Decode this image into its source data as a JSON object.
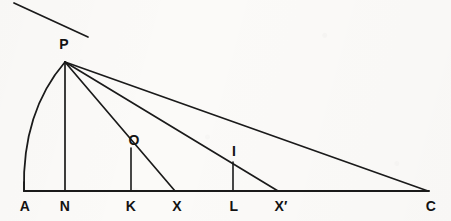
{
  "figure": {
    "kind": "geometric-construction-diagram",
    "canvas": {
      "width": 451,
      "height": 221
    },
    "colors": {
      "background": "#fbfaf8",
      "ink": "#1a1a1a",
      "label_ink": "#131313"
    },
    "baseline": {
      "name": "AC",
      "y": 191,
      "x_start": 24,
      "x_end": 429
    },
    "apex": {
      "label": "P",
      "x": 65,
      "y": 62
    },
    "tangent_line": {
      "x1": 14,
      "y1": 3,
      "x2": 88,
      "y2": 37,
      "through": "P"
    },
    "arc": {
      "from": "A",
      "to": "P",
      "start_x": 24,
      "start_y": 191,
      "end_x": 65,
      "end_y": 62,
      "control_x": 22,
      "control_y": 112
    },
    "points": [
      {
        "label": "A",
        "x": 24,
        "y": 191,
        "label_x": 25,
        "label_y": 206
      },
      {
        "label": "N",
        "x": 65,
        "y": 191,
        "label_x": 65,
        "label_y": 206
      },
      {
        "label": "K",
        "x": 131,
        "y": 191,
        "label_x": 131,
        "label_y": 206
      },
      {
        "label": "X",
        "x": 175,
        "y": 191,
        "label_x": 177,
        "label_y": 206
      },
      {
        "label": "L",
        "x": 233,
        "y": 191,
        "label_x": 234,
        "label_y": 206
      },
      {
        "label": "X′",
        "x": 278,
        "y": 191,
        "label_x": 281,
        "label_y": 206
      },
      {
        "label": "C",
        "x": 428,
        "y": 191,
        "label_x": 431,
        "label_y": 206
      },
      {
        "label": "P",
        "x": 65,
        "y": 62,
        "label_x": 64,
        "label_y": 44
      },
      {
        "label": "O",
        "x": 131,
        "y": 148,
        "label_x": 134,
        "label_y": 140
      },
      {
        "label": "I",
        "x": 233,
        "y": 162,
        "label_x": 234,
        "label_y": 151
      }
    ],
    "segments": [
      {
        "name": "baseline-A-C",
        "x1": 24,
        "y1": 191,
        "x2": 429,
        "y2": 191,
        "width": 2.0
      },
      {
        "name": "perpendicular-P-N",
        "x1": 65,
        "y1": 62,
        "x2": 65,
        "y2": 191,
        "width": 1.7
      },
      {
        "name": "ray-P-X",
        "x1": 65,
        "y1": 62,
        "x2": 175,
        "y2": 191,
        "width": 1.7
      },
      {
        "name": "ray-P-Xprime",
        "x1": 65,
        "y1": 62,
        "x2": 278,
        "y2": 191,
        "width": 1.7
      },
      {
        "name": "ray-P-C",
        "x1": 65,
        "y1": 62,
        "x2": 428,
        "y2": 191,
        "width": 1.7
      },
      {
        "name": "perpendicular-O-K",
        "x1": 131,
        "y1": 148,
        "x2": 131,
        "y2": 191,
        "width": 1.6
      },
      {
        "name": "perpendicular-I-L",
        "x1": 233,
        "y1": 162,
        "x2": 233,
        "y2": 191,
        "width": 1.6
      },
      {
        "name": "tick-A-end",
        "x1": 24,
        "y1": 182,
        "x2": 24,
        "y2": 191,
        "width": 1.6
      }
    ],
    "labels": {
      "A": "A",
      "N": "N",
      "K": "K",
      "X": "X",
      "L": "L",
      "Xprime": "X′",
      "C": "C",
      "P": "P",
      "O": "O",
      "I": "I"
    }
  }
}
